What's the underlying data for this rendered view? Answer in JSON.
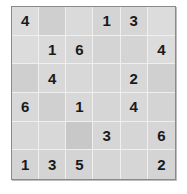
{
  "puzzle": {
    "rows": 6,
    "cols": 6,
    "grid": [
      [
        "4",
        "",
        "",
        "1",
        "3",
        ""
      ],
      [
        "",
        "1",
        "6",
        "",
        "",
        "4"
      ],
      [
        "",
        "4",
        "",
        "",
        "2",
        ""
      ],
      [
        "6",
        "",
        "1",
        "",
        "4",
        ""
      ],
      [
        "",
        "",
        "",
        "3",
        "",
        "6"
      ],
      [
        "1",
        "3",
        "5",
        "",
        "",
        "2"
      ]
    ],
    "shading": [
      [
        "#dcdcdc",
        "#cfcfcf",
        "#dadada",
        "#d4d4d4",
        "#d6d6d6",
        "#dcdcdc"
      ],
      [
        "#dcdcdc",
        "#dadada",
        "#d8d8d8",
        "#d4d4d4",
        "#d4d4d4",
        "#dcdcdc"
      ],
      [
        "#cfcfcf",
        "#d8d8d8",
        "#d8d8d8",
        "#d6d6d6",
        "#d8d8d8",
        "#d0d0d0"
      ],
      [
        "#d8d8d8",
        "#d0d0d0",
        "#d8d8d8",
        "#d6d6d6",
        "#d8d8d8",
        "#d4d4d4"
      ],
      [
        "#d8d8d8",
        "#d8d8d8",
        "#c8c8c8",
        "#d6d6d6",
        "#d6d6d6",
        "#d6d6d6"
      ],
      [
        "#d4d4d4",
        "#d4d4d4",
        "#d4d4d4",
        "#d6d6d6",
        "#d6d6d6",
        "#d4d4d4"
      ]
    ]
  }
}
